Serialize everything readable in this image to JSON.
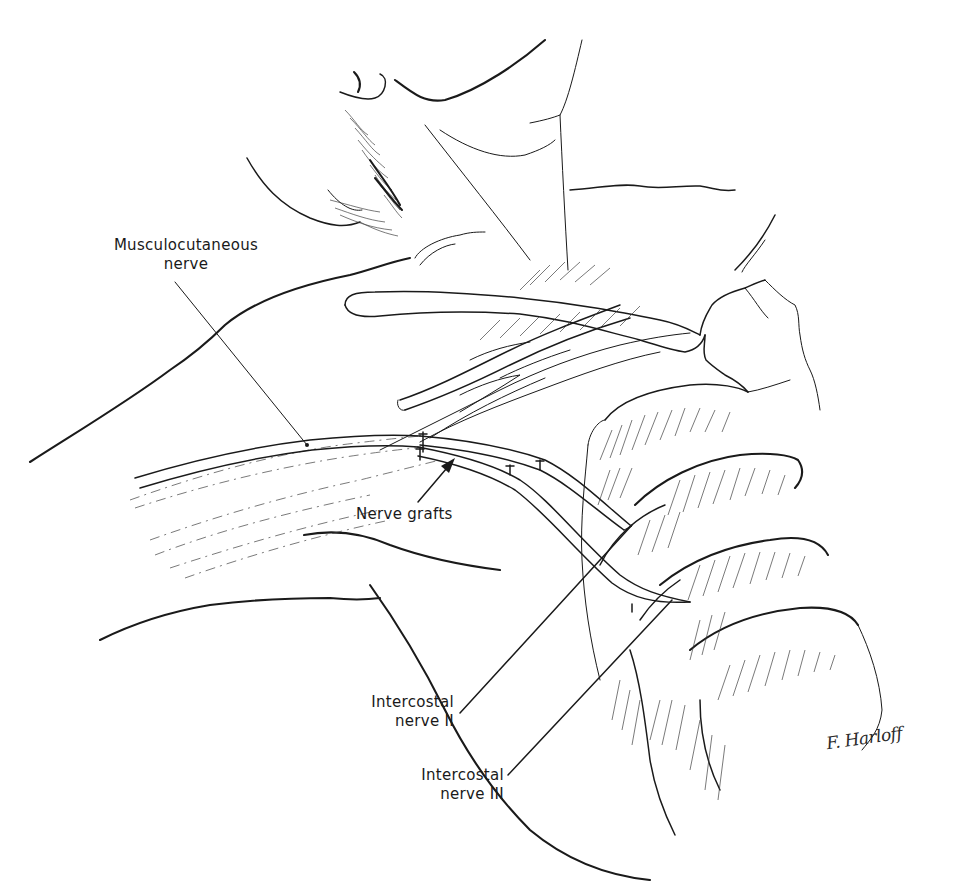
{
  "figure": {
    "type": "anatomical-line-illustration",
    "line_color": "#1a1a1a",
    "background": "#ffffff"
  },
  "labels": {
    "musculocutaneous": {
      "line1": "Musculocutaneous",
      "line2": "nerve"
    },
    "nerve_grafts": {
      "text": "Nerve grafts"
    },
    "intercostal_ii": {
      "line1": "Intercostal",
      "line2": "nerve II"
    },
    "intercostal_iii": {
      "line1": "Intercostal",
      "line2": "nerve III"
    }
  },
  "signature": {
    "text": "F. Harloff"
  }
}
